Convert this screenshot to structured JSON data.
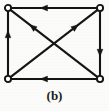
{
  "figure": {
    "caption": "(b)",
    "kind": "directed-graph",
    "background_color": "#fbfbf9",
    "ink_color": "#141414",
    "node_fill_color": "#ffffff",
    "stroke_width": 2.1,
    "nodes": [
      {
        "id": "tl",
        "label": "",
        "x": 8,
        "y": 8,
        "r": 3.1,
        "name": "node-top-left"
      },
      {
        "id": "tr",
        "label": "",
        "x": 100,
        "y": 8,
        "r": 3.1,
        "name": "node-top-right"
      },
      {
        "id": "bl",
        "label": "",
        "x": 8,
        "y": 79,
        "r": 3.1,
        "name": "node-bottom-left"
      },
      {
        "id": "br",
        "label": "",
        "x": 100,
        "y": 79,
        "r": 3.1,
        "name": "node-bottom-right"
      }
    ],
    "edges": [
      {
        "id": "e-top",
        "from": "tr",
        "to": "tl",
        "arrow_at": 0.66,
        "name": "edge-top-right-to-top-left"
      },
      {
        "id": "e-left",
        "from": "bl",
        "to": "tl",
        "arrow_at": 0.7,
        "name": "edge-bottom-left-to-top-left"
      },
      {
        "id": "e-bottom",
        "from": "br",
        "to": "bl",
        "arrow_at": 0.66,
        "name": "edge-bottom-right-to-bottom-left"
      },
      {
        "id": "e-right",
        "from": "tr",
        "to": "br",
        "arrow_at": 0.7,
        "name": "edge-top-right-to-bottom-right"
      },
      {
        "id": "e-diag-nw",
        "from": "br",
        "to": "tl",
        "arrow_at": 0.78,
        "name": "edge-bottom-right-to-top-left"
      },
      {
        "id": "e-diag-ne",
        "from": "bl",
        "to": "tr",
        "arrow_at": 0.78,
        "name": "edge-bottom-left-to-top-right"
      }
    ]
  }
}
